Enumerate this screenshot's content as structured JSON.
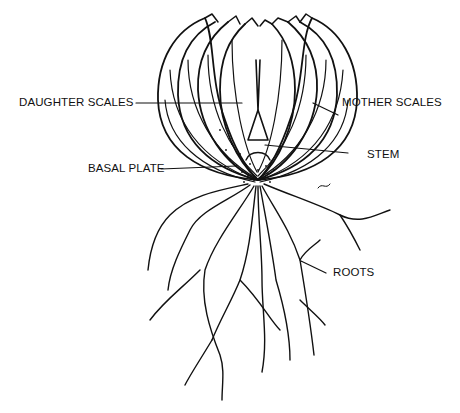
{
  "diagram": {
    "labels": {
      "daughter_scales": "DAUGHTER SCALES",
      "mother_scales": "MOTHER SCALES",
      "basal_plate": "BASAL PLATE",
      "stem": "STEM",
      "roots": "ROOTS"
    },
    "colors": {
      "ink": "#111111",
      "background": "#ffffff"
    }
  }
}
